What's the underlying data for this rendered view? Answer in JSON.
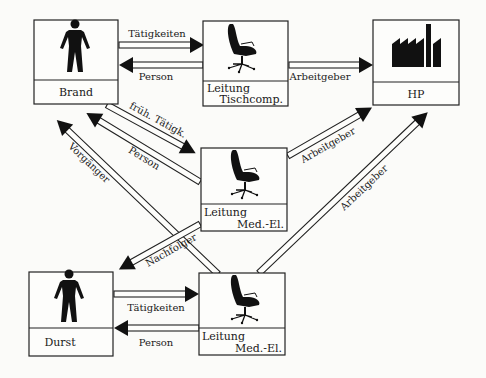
{
  "nodes": {
    "brand": {
      "label": "Brand",
      "icon": "person-icon"
    },
    "leitung_tisch": {
      "label_line1": "Leitung",
      "label_line2": "Tischcomp.",
      "icon": "office-chair-icon"
    },
    "hp": {
      "label": "HP",
      "icon": "factory-icon"
    },
    "leitung_med_mid": {
      "label_line1": "Leitung",
      "label_line2": "Med.-El.",
      "icon": "office-chair-icon"
    },
    "durst": {
      "label": "Durst",
      "icon": "person-icon"
    },
    "leitung_med_bottom": {
      "label_line1": "Leitung",
      "label_line2": "Med.-El.",
      "icon": "office-chair-icon"
    }
  },
  "edges": {
    "brand_to_tisch": {
      "label": "Tätigkeiten"
    },
    "tisch_to_brand": {
      "label": "Person"
    },
    "tisch_to_hp": {
      "label": "Arbeitgeber"
    },
    "brand_to_mid": {
      "label": "früh. Tätigk."
    },
    "mid_to_brand": {
      "label": "Person"
    },
    "bottom_to_brand": {
      "label": "Vorgänger"
    },
    "mid_to_hp": {
      "label": "Arbeitgeber"
    },
    "mid_to_durst": {
      "label": "Nachfolger"
    },
    "bottom_to_hp": {
      "label": "Arbeitgeber"
    },
    "durst_to_bottom": {
      "label": "Tätigkeiten"
    },
    "bottom_to_durst": {
      "label": "Person"
    }
  }
}
